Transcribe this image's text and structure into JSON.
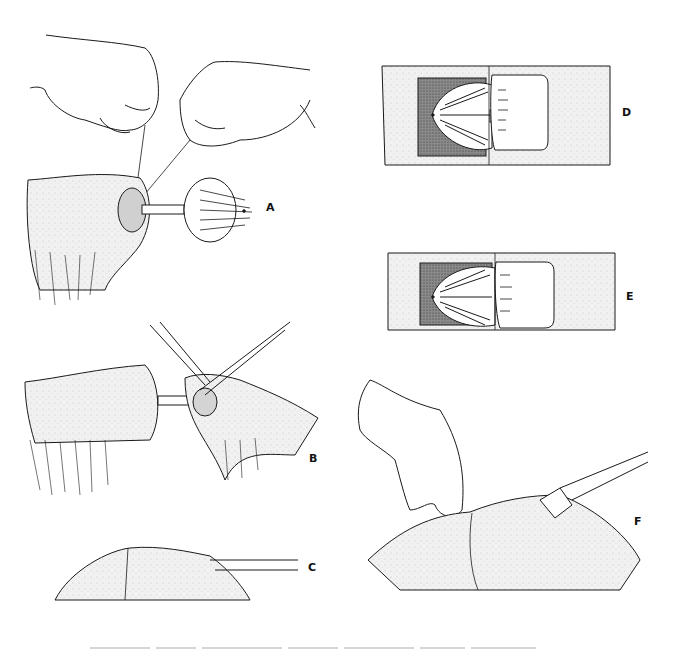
{
  "figure": {
    "panels": [
      {
        "id": "A",
        "label": "A",
        "description": "Two hands tying purse-string suture around anvil shaft in bowel end"
      },
      {
        "id": "B",
        "label": "B",
        "description": "Second purse-string tied around shaft with forceps"
      },
      {
        "id": "C",
        "label": "C",
        "description": "Bowel ends approximated over instrument shaft"
      },
      {
        "id": "D",
        "label": "D",
        "description": "Cutaway view: anvil and cartridge approaching within lumen"
      },
      {
        "id": "E",
        "label": "E",
        "description": "Cutaway view: anvil closed against cartridge, staples fired"
      },
      {
        "id": "F",
        "label": "F",
        "description": "Hand inspecting completed anastomosis with instrument shaft"
      }
    ],
    "colors": {
      "ink": "#1a1a1a",
      "stipple": "#ececec",
      "shade": "#9a9a9a",
      "paper": "#ffffff"
    }
  }
}
